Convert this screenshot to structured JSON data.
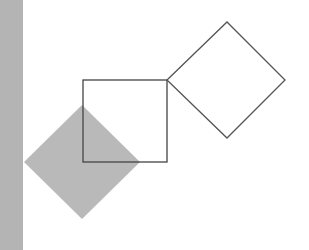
{
  "canvas": {
    "width": 309,
    "height": 250,
    "background": "#ffffff"
  },
  "shapes": {
    "side_bar": {
      "x": 0,
      "y": 0,
      "width": 23,
      "height": 250,
      "fill": "#b4b4b4"
    },
    "filled_diamond": {
      "points": "24,162 82,105 140,162 82,219",
      "fill": "#b9b9b9"
    },
    "outlined_square": {
      "x": 83,
      "y": 80,
      "width": 84,
      "height": 82,
      "stroke": "#444444",
      "stroke_width": 1.3
    },
    "outlined_diamond": {
      "points": "167,80 227,22 285,80 227,138",
      "stroke": "#555555",
      "stroke_width": 1.3
    }
  },
  "colors": {
    "gray_fill": "#b9b9b9",
    "bar_fill": "#b4b4b4",
    "outline": "#444444"
  }
}
